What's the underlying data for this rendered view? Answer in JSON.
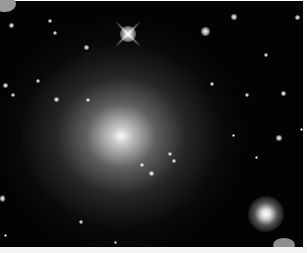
{
  "image": {
    "subject": "elliptical galaxy with foreground field stars",
    "background_color": "#030303",
    "border_color": "#ffffff",
    "galaxy_core": {
      "x": 121,
      "y": 135
    },
    "bright_star_spiked": {
      "x": 128,
      "y": 33
    },
    "bright_star_lower_right": {
      "x": 266,
      "y": 213
    }
  }
}
